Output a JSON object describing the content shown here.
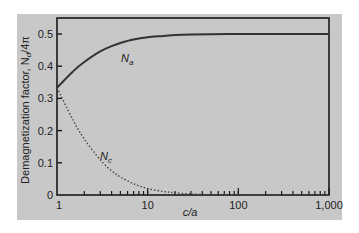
{
  "chart_data": {
    "type": "line",
    "title": "",
    "xlabel": "c/a",
    "ylabel": "Demagnetization factor, N_d/4π",
    "ylabel_parts": {
      "main": "Demagnetization factor, N",
      "sub": "d",
      "tail": "/4π"
    },
    "xscale": "log",
    "xlim": [
      1,
      1000
    ],
    "ylim": [
      0,
      0.55
    ],
    "grid": false,
    "legend": "inline labels",
    "x_ticks": [
      {
        "value": 1,
        "label": "1"
      },
      {
        "value": 10,
        "label": "10"
      },
      {
        "value": 100,
        "label": "100"
      },
      {
        "value": 1000,
        "label": "1,000"
      }
    ],
    "y_ticks": [
      {
        "value": 0,
        "label": "0"
      },
      {
        "value": 0.1,
        "label": "0.1"
      },
      {
        "value": 0.2,
        "label": "0.2"
      },
      {
        "value": 0.3,
        "label": "0.3"
      },
      {
        "value": 0.4,
        "label": "0.4"
      },
      {
        "value": 0.5,
        "label": "0.5"
      }
    ],
    "x": [
      1,
      1.5,
      2,
      3,
      4,
      5,
      7,
      10,
      15,
      20,
      30,
      50,
      100,
      200,
      500,
      1000
    ],
    "series": [
      {
        "name": "Na",
        "label_main": "N",
        "label_sub": "a",
        "style": "solid",
        "values": [
          0.333,
          0.384,
          0.413,
          0.446,
          0.462,
          0.472,
          0.483,
          0.49,
          0.494,
          0.497,
          0.498,
          0.499,
          0.5,
          0.5,
          0.5,
          0.5
        ]
      },
      {
        "name": "Nc",
        "label_main": "N",
        "label_sub": "c",
        "style": "dotted",
        "values": [
          0.333,
          0.233,
          0.174,
          0.109,
          0.075,
          0.056,
          0.035,
          0.02,
          0.011,
          0.007,
          0.003,
          0.001,
          0.0004,
          0.0001,
          0.0,
          0.0
        ]
      }
    ]
  }
}
